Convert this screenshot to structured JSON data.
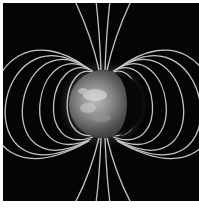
{
  "image": {
    "subject": "Earth with dipole magnetic field lines",
    "background_color": "#050505",
    "border_color": "#ffffff",
    "field_line_color": "#d8d8d8"
  }
}
